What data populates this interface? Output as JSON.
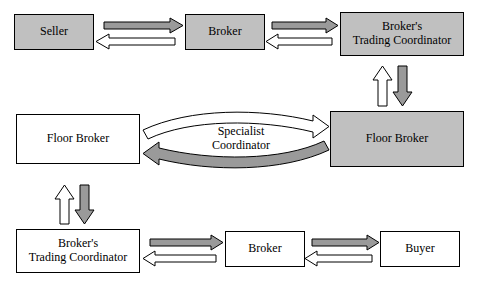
{
  "diagram": {
    "colors": {
      "fill_gray": "#c0c0c0",
      "fill_white": "#ffffff",
      "stroke": "#000000",
      "arrow_gray": "#808080",
      "background": "#ffffff"
    },
    "nodes": [
      {
        "id": "seller",
        "label": "Seller",
        "fill": "gray",
        "x": 14,
        "y": 14,
        "w": 80,
        "h": 36
      },
      {
        "id": "broker_top",
        "label": "Broker",
        "fill": "gray",
        "x": 185,
        "y": 14,
        "w": 80,
        "h": 36
      },
      {
        "id": "btc_top",
        "label": "Broker's\nTrading Coordinator",
        "fill": "gray",
        "x": 340,
        "y": 12,
        "w": 124,
        "h": 44
      },
      {
        "id": "floor_left",
        "label": "Floor Broker",
        "fill": "white",
        "x": 16,
        "y": 114,
        "w": 124,
        "h": 50
      },
      {
        "id": "floor_right",
        "label": "Floor Broker",
        "fill": "gray",
        "x": 330,
        "y": 111,
        "w": 134,
        "h": 56
      },
      {
        "id": "btc_bottom",
        "label": "Broker's\nTrading Coordinator",
        "fill": "white",
        "x": 16,
        "y": 229,
        "w": 124,
        "h": 44
      },
      {
        "id": "broker_bot",
        "label": "Broker",
        "fill": "white",
        "x": 225,
        "y": 231,
        "w": 80,
        "h": 36
      },
      {
        "id": "buyer",
        "label": "Buyer",
        "fill": "white",
        "x": 380,
        "y": 231,
        "w": 80,
        "h": 36
      }
    ],
    "center_label": {
      "line1": "Specialist",
      "line2": "Coordinator"
    },
    "arrows": [
      {
        "name": "seller-to-broker",
        "style": "gray",
        "direction": "right"
      },
      {
        "name": "broker-to-seller",
        "style": "white",
        "direction": "left"
      },
      {
        "name": "broker-to-coordinator",
        "style": "gray",
        "direction": "right"
      },
      {
        "name": "coordinator-to-broker",
        "style": "white",
        "direction": "left"
      },
      {
        "name": "coordinator-to-floor-broker",
        "style": "gray",
        "direction": "down"
      },
      {
        "name": "floor-broker-to-coordinator",
        "style": "white",
        "direction": "up"
      },
      {
        "name": "floor-left-to-floor-right",
        "style": "white",
        "direction": "right"
      },
      {
        "name": "floor-right-to-floor-left",
        "style": "gray",
        "direction": "left"
      },
      {
        "name": "floor-left-to-coordinator",
        "style": "gray",
        "direction": "down"
      },
      {
        "name": "coordinator-to-floor-left",
        "style": "white",
        "direction": "up"
      },
      {
        "name": "coordinator-to-broker-bottom",
        "style": "gray",
        "direction": "right"
      },
      {
        "name": "broker-bottom-to-coordinator",
        "style": "white",
        "direction": "left"
      },
      {
        "name": "broker-bottom-to-buyer",
        "style": "gray",
        "direction": "right"
      },
      {
        "name": "buyer-to-broker-bottom",
        "style": "white",
        "direction": "left"
      }
    ]
  }
}
